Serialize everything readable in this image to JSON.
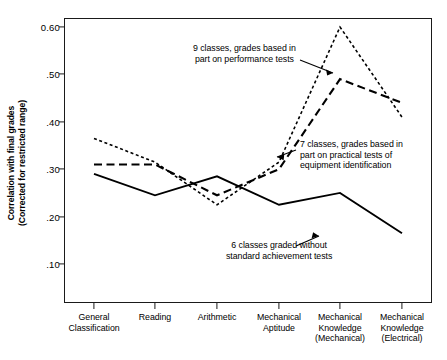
{
  "chart_data": {
    "type": "line",
    "title": "",
    "xlabel": "",
    "ylabel": "Correlation with final grades (Corrected for restricted range)",
    "ylabel_line1": "Correlation with final grades",
    "ylabel_line2": "(Corrected for restricted range)",
    "categories": [
      "General Classification",
      "Reading",
      "Arithmetic",
      "Mechanical Aptitude",
      "Mechanical Knowledge (Mechanical)",
      "Mechanical Knowledge (Electrical)"
    ],
    "category_labels": [
      [
        "General",
        "Classification"
      ],
      [
        "Reading"
      ],
      [
        "Arithmetic"
      ],
      [
        "Mechanical",
        "Aptitude"
      ],
      [
        "Mechanical",
        "Knowledge",
        "(Mechanical)"
      ],
      [
        "Mechanical",
        "Knowledge",
        "(Electrical)"
      ]
    ],
    "ylim": [
      0.05,
      0.65
    ],
    "yticks": [
      0.6,
      0.5,
      0.4,
      0.3,
      0.2,
      0.1
    ],
    "ytick_labels": [
      "0.60",
      ".50",
      ".40",
      ".30",
      ".20",
      ".10"
    ],
    "grid": false,
    "legend": "annotations",
    "series": [
      {
        "name": "9 classes, grades based in part on performance tests",
        "style": "dotted",
        "values": [
          0.365,
          0.315,
          0.225,
          0.315,
          0.6,
          0.41
        ]
      },
      {
        "name": "7 classes, grades based in part on practical tests of equipment identification",
        "style": "dashed",
        "values": [
          0.31,
          0.31,
          0.245,
          0.3,
          0.49,
          0.44
        ]
      },
      {
        "name": "6 classes graded without standard achievement tests",
        "style": "solid",
        "values": [
          0.29,
          0.245,
          0.285,
          0.225,
          0.25,
          0.165
        ]
      }
    ],
    "annotations": [
      {
        "id": "annot-9-classes",
        "text": "9 classes, grades based in\npart on performance tests"
      },
      {
        "id": "annot-7-classes",
        "text": "7 classes, grades based in\npart on practical tests of\nequipment identification"
      },
      {
        "id": "annot-6-classes",
        "text": "6 classes graded without\nstandard achievement tests"
      }
    ],
    "colors": {
      "axis": "#1a1a1a",
      "series": "#000000",
      "background": "#ffffff"
    }
  }
}
